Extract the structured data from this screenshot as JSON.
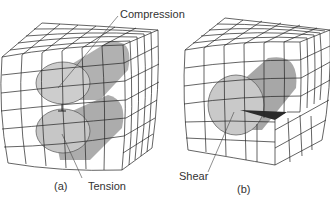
{
  "figure": {
    "panels": [
      {
        "id": "a",
        "caption": "(a)",
        "callouts": [
          {
            "label": "Compression"
          },
          {
            "label": "Tension"
          }
        ]
      },
      {
        "id": "b",
        "caption": "(b)",
        "callouts": [
          {
            "label": "Shear"
          }
        ]
      }
    ]
  },
  "colors": {
    "grid_line": "#222222",
    "cylinder_dark": "#9a9a9a",
    "cylinder_mid": "#b5b5b5",
    "cylinder_face": "#cfcfcf",
    "shear_wedge": "#2b2b2b",
    "text": "#333333"
  }
}
